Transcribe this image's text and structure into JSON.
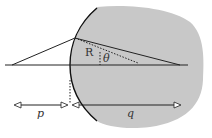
{
  "diagram": {
    "labels": {
      "radius": "R",
      "angle": "θ",
      "object_distance": "p",
      "image_distance": "q"
    },
    "colors": {
      "medium": "#c8c8c8",
      "lines": "#222222"
    }
  }
}
